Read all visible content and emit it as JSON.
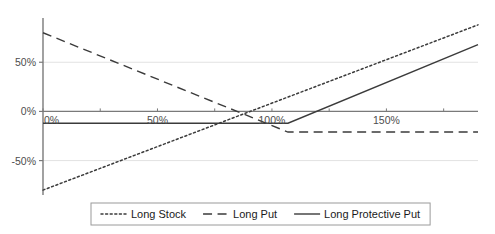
{
  "chart_data": {
    "type": "line",
    "title": "",
    "subtitle": "",
    "xlabel": "",
    "ylabel": "",
    "xlim": [
      0,
      190
    ],
    "ylim": [
      -85,
      95
    ],
    "grid": true,
    "legend_position": "bottom",
    "x_ticks": [
      {
        "value": 0,
        "label": "0%"
      },
      {
        "value": 50,
        "label": "50%"
      },
      {
        "value": 100,
        "label": "100%"
      },
      {
        "value": 150,
        "label": "150%"
      }
    ],
    "y_ticks": [
      {
        "value": 50,
        "label": "50%"
      },
      {
        "value": 0,
        "label": "0%"
      },
      {
        "value": -50,
        "label": "-50%"
      }
    ],
    "strike": 107,
    "series": [
      {
        "name": "Long Stock",
        "style": "dotted",
        "color": "#3b3b3b",
        "points": [
          [
            0,
            -80
          ],
          [
            190,
            88
          ]
        ]
      },
      {
        "name": "Long Put",
        "style": "dashed",
        "color": "#3b3b3b",
        "points": [
          [
            0,
            80
          ],
          [
            107,
            -21
          ],
          [
            190,
            -21
          ]
        ]
      },
      {
        "name": "Long Protective Put",
        "style": "solid",
        "color": "#3b3b3b",
        "points": [
          [
            0,
            -12
          ],
          [
            107,
            -12
          ],
          [
            190,
            68
          ]
        ]
      }
    ]
  },
  "legend": {
    "items": [
      {
        "label": "Long Stock",
        "style": "dotted"
      },
      {
        "label": "Long Put",
        "style": "dashed"
      },
      {
        "label": "Long Protective Put",
        "style": "solid"
      }
    ]
  },
  "colors": {
    "axis": "#7a7a7a",
    "grid": "#e2e2e2",
    "series": "#3b3b3b",
    "tick_text": "#4d4d4d",
    "legend_border": "#9a9a9a",
    "background": "#ffffff"
  }
}
